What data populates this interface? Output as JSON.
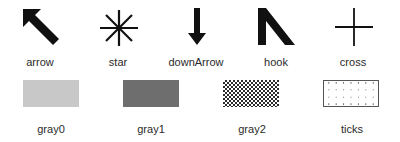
{
  "bitmaps": [
    {
      "name": "arrow",
      "icon": "arrow-up-left-icon"
    },
    {
      "name": "star",
      "icon": "star-asterisk-icon"
    },
    {
      "name": "downArrow",
      "icon": "down-arrow-icon"
    },
    {
      "name": "hook",
      "icon": "hook-icon"
    },
    {
      "name": "cross",
      "icon": "cross-icon"
    }
  ],
  "stipples": [
    {
      "name": "gray0",
      "color": "#c8c8c8"
    },
    {
      "name": "gray1",
      "color": "#6e6e6e"
    },
    {
      "name": "gray2",
      "color": "#2e2e2e"
    },
    {
      "name": "ticks",
      "color": "#555555"
    }
  ]
}
